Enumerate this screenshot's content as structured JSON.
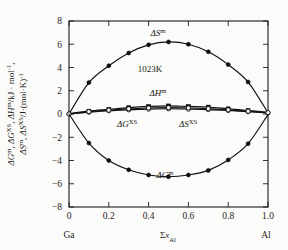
{
  "chart_data": {
    "type": "line",
    "title": "",
    "annotation": "1023K",
    "xlabel": "Σx_Al",
    "ylabel_line1": "ΔG^m, ΔG^XS, ΔH^m/kJ·mol⁻¹,",
    "ylabel_line2": "ΔS^m, ΔS^XS/J·(mol·K)⁻¹",
    "xlim": [
      0,
      1.0
    ],
    "ylim": [
      -8,
      8
    ],
    "xticks": [
      "0",
      "0.2",
      "0.4",
      "0.6",
      "0.8",
      "1.0"
    ],
    "xtick_values": [
      0,
      0.2,
      0.4,
      0.6,
      0.8,
      1.0
    ],
    "yticks": [
      "8",
      "6",
      "4",
      "2",
      "0",
      "-2",
      "-4",
      "-6",
      "-8"
    ],
    "ytick_values": [
      8,
      6,
      4,
      2,
      0,
      -2,
      -4,
      -6,
      -8
    ],
    "grid": false,
    "legend_position": "inline-annotations",
    "left_endmember": "Ga",
    "right_endmember": "Al",
    "x": [
      0,
      0.1,
      0.2,
      0.3,
      0.4,
      0.5,
      0.6,
      0.7,
      0.8,
      0.9,
      1.0
    ],
    "series": [
      {
        "name": "ΔS^m",
        "label": "ΔS",
        "label_sup": "m",
        "marker": "filled-circle",
        "values": [
          0,
          2.7,
          4.15,
          5.25,
          5.95,
          6.2,
          6.0,
          5.35,
          4.25,
          2.75,
          0.1
        ]
      },
      {
        "name": "ΔH^m",
        "label": "ΔH",
        "label_sup": "m",
        "marker": "filled-square",
        "values": [
          0.05,
          0.25,
          0.4,
          0.55,
          0.65,
          0.7,
          0.65,
          0.6,
          0.45,
          0.3,
          0.15
        ]
      },
      {
        "name": "ΔG^XS",
        "label": "ΔG",
        "label_sup": "XS",
        "marker": "open-circle",
        "values": [
          0.0,
          0.15,
          0.28,
          0.36,
          0.42,
          0.45,
          0.42,
          0.38,
          0.3,
          0.2,
          0.1
        ]
      },
      {
        "name": "ΔS^XS",
        "label": "ΔS",
        "label_sup": "XS",
        "marker": "open-circle",
        "values": [
          0.0,
          0.2,
          0.33,
          0.45,
          0.52,
          0.55,
          0.52,
          0.46,
          0.36,
          0.24,
          0.12
        ]
      },
      {
        "name": "ΔG^m",
        "label": "ΔG",
        "label_sup": "m",
        "marker": "filled-circle",
        "values": [
          0.0,
          -2.5,
          -4.0,
          -4.8,
          -5.25,
          -5.4,
          -5.25,
          -4.85,
          -3.95,
          -2.55,
          -0.05
        ]
      }
    ]
  },
  "labels": {
    "delta_s_m": {
      "head": "ΔS",
      "sup": "m"
    },
    "delta_h_m": {
      "head": "ΔH",
      "sup": "m"
    },
    "delta_g_xs": {
      "head": "ΔG",
      "sup": "XS"
    },
    "delta_s_xs": {
      "head": "ΔS",
      "sup": "XS"
    },
    "delta_g_m": {
      "head": "ΔG",
      "sup": "m"
    },
    "temperature": "1023K",
    "x_axis_sigma": "Σx",
    "x_axis_sub": "Al",
    "left_end": "Ga",
    "right_end": "Al"
  },
  "colors": {
    "axis": "#1a1a1a",
    "curve": "#101010",
    "background": "#fbfbf9",
    "marker_fill": "#0d0d0d",
    "marker_open": "#fbfbf9"
  }
}
